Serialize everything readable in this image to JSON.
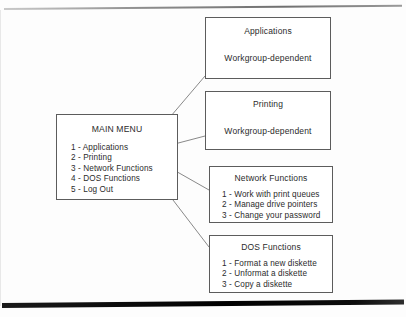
{
  "diagram": {
    "main_menu": {
      "title": "MAIN MENU",
      "items": [
        "1 - Applications",
        "2 - Printing",
        "3 - Network Functions",
        "4 - DOS Functions",
        "5 - Log Out"
      ]
    },
    "boxes": [
      {
        "id": "applications",
        "title": "Applications",
        "subtitle": "Workgroup-dependent"
      },
      {
        "id": "printing",
        "title": "Printing",
        "subtitle": "Workgroup-dependent"
      },
      {
        "id": "network_functions",
        "title": "Network Functions",
        "items": [
          "1 - Work with print queues",
          "2 - Manage drive pointers",
          "3 - Change your password"
        ]
      },
      {
        "id": "dos_functions",
        "title": "DOS Functions",
        "items": [
          "1 - Format a new diskette",
          "2 - Unformat a diskette",
          "3 - Copy a diskette"
        ]
      }
    ]
  },
  "colors": {
    "page_background": "#fdfdfd",
    "box_border": "#5c5c5c",
    "text": "#2b2b2b",
    "connector": "#6b6b6b",
    "bottom_bar": "#000000"
  }
}
